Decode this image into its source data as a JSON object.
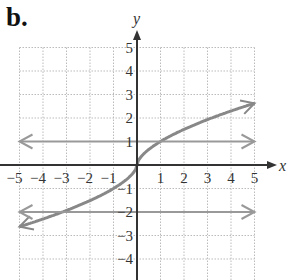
{
  "panel_label": "b.",
  "chart_data": {
    "type": "line",
    "title": "",
    "xlabel": "x",
    "ylabel": "y",
    "xlim": [
      -5,
      5
    ],
    "ylim": [
      -4.5,
      5
    ],
    "x_ticks": [
      "-5",
      "-4",
      "-3",
      "-2",
      "-1",
      "1",
      "2",
      "3",
      "4",
      "5"
    ],
    "y_ticks": [
      "5",
      "4",
      "3",
      "2",
      "1",
      "-1",
      "-2",
      "-3",
      "-4"
    ],
    "grid": true,
    "series": [
      {
        "name": "curve",
        "x": [
          -5,
          -4,
          -3,
          -2,
          -1,
          0,
          1,
          2,
          3,
          4,
          5
        ],
        "y": [
          -2.6,
          -2.3,
          -1.9,
          -1.5,
          -1,
          0,
          1,
          1.5,
          1.9,
          2.3,
          2.6
        ],
        "arrows": "both",
        "color": "#888888"
      },
      {
        "name": "horizontal line y=1",
        "x": [
          -5,
          5
        ],
        "y": [
          1,
          1
        ],
        "arrows": "both",
        "color": "#999999"
      },
      {
        "name": "horizontal line y=-2",
        "x": [
          -5,
          5
        ],
        "y": [
          -2,
          -2
        ],
        "arrows": "both",
        "color": "#999999"
      }
    ]
  },
  "colors": {
    "axis": "#333333",
    "grid": "#bbbbbb",
    "curve": "#888888",
    "hline": "#999999"
  }
}
